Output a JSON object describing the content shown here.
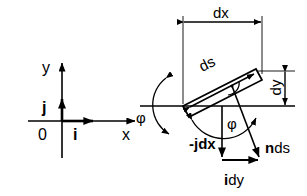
{
  "figure": {
    "type": "technical-vector-diagram",
    "stroke_color": "#000000",
    "background_color": "#ffffff",
    "width": 307,
    "height": 196
  },
  "left_panel": {
    "name": "cartesian-axes",
    "origin_label": "0",
    "y_axis_label": "y",
    "x_axis_label": "x",
    "unit_vector_x_label": "i",
    "unit_vector_y_label": "j",
    "axes": {
      "origin_px": [
        62,
        121
      ],
      "x_axis_from_px": [
        28,
        121
      ],
      "x_axis_to_px": [
        135,
        121
      ],
      "y_axis_from_px": [
        62,
        155
      ],
      "y_axis_to_px": [
        62,
        62
      ],
      "i_arrow_from_px": [
        62,
        121
      ],
      "i_arrow_to_px": [
        94,
        121
      ],
      "j_arrow_from_px": [
        62,
        121
      ],
      "j_arrow_to_px": [
        62,
        98
      ]
    }
  },
  "right_panel": {
    "name": "line-element-normal",
    "labels": {
      "dx": "dx",
      "dy": "dy",
      "ds": "ds",
      "phi_left": "φ",
      "phi_center": "φ",
      "minus_j_dx": "-jdx",
      "n_ds_bold": "n",
      "n_ds_rest": "ds",
      "i_dy_bold": "i",
      "i_dy_rest": "dy"
    },
    "geometry": {
      "element_lower_left_px": [
        183,
        106
      ],
      "element_upper_right_px": [
        262,
        67
      ],
      "element_thickness_px": 13,
      "tilt_degrees": 27,
      "horizontal_line_from_px": [
        140,
        106
      ],
      "horizontal_line_to_px": [
        295,
        106
      ],
      "dx_dimension_y_px": 22,
      "dx_dimension_from_x_px": [
        183
      ],
      "dx_dimension_to_x_px": [
        262
      ],
      "dy_dimension_x_px": 283,
      "dy_dimension_from_y_px": [
        67
      ],
      "dy_dimension_to_y_px": [
        106
      ],
      "triangle_apex_px": [
        222,
        106
      ],
      "minus_jdx_tip_px": [
        222,
        160
      ],
      "idy_tip_px": [
        260,
        160
      ],
      "nds_tip_px": [
        260,
        160
      ],
      "right_angle_marker_px": [
        232,
        88
      ]
    },
    "annotations": {
      "right_angle_marker": "perpendicular",
      "phi_arc_left": "rotation arc at element lower-left vertex",
      "phi_arc_center": "angle from horizontal to n ds"
    }
  }
}
